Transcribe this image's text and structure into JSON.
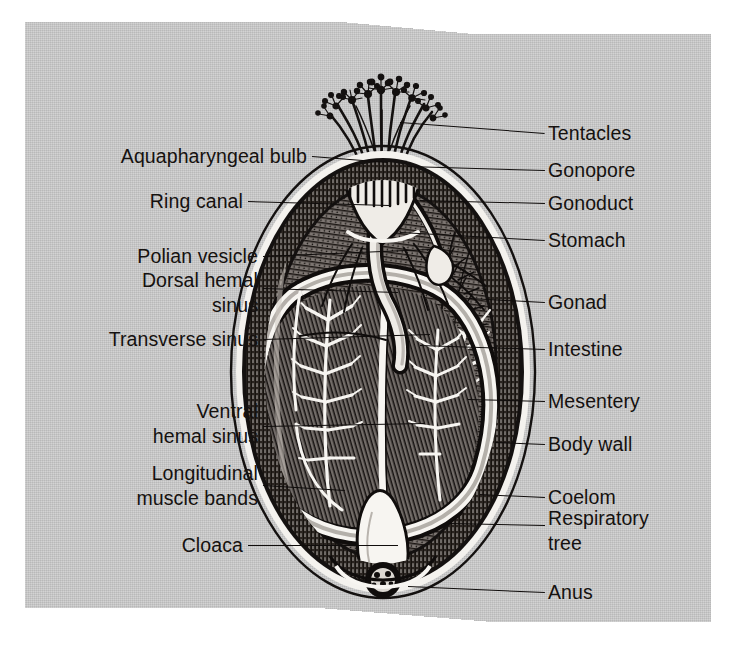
{
  "figure": {
    "background_color": "#c9c9c9",
    "page_color": "#ffffff",
    "ink_color": "#100d0c"
  },
  "labels": {
    "left": [
      {
        "id": "aquapharyngeal-bulb",
        "text": "Aquapharyngeal bulb",
        "x": 307,
        "y": 156,
        "line_x1": 312,
        "line_x2": 388,
        "line_y1": 156,
        "line_y2": 162
      },
      {
        "id": "ring-canal",
        "text": "Ring canal",
        "x": 243,
        "y": 201,
        "line_x1": 248,
        "line_x2": 389,
        "line_y1": 201,
        "line_y2": 205
      },
      {
        "id": "polian-vesicle",
        "text": "Polian vesicle",
        "x": 258,
        "y": 256,
        "line_x1": 263,
        "line_x2": 430,
        "line_y1": 256,
        "line_y2": 249
      },
      {
        "id": "dorsal-hemal-sinus",
        "text": "Dorsal hemal\nsinus",
        "x": 258,
        "y": 293,
        "line_x1": 263,
        "line_x2": 398,
        "line_y1": 288,
        "line_y2": 292
      },
      {
        "id": "transverse-sinus",
        "text": "Transverse sinus",
        "x": 258,
        "y": 339,
        "line_x1": 263,
        "line_x2": 430,
        "line_y1": 339,
        "line_y2": 334
      },
      {
        "id": "ventral-hemal-sinus",
        "text": "Ventral\nhemal sinus",
        "x": 258,
        "y": 424,
        "line_x1": 263,
        "line_x2": 425,
        "line_y1": 426,
        "line_y2": 423
      },
      {
        "id": "longitudinal-muscle-bands",
        "text": "Longitudinal\nmuscle bands",
        "x": 258,
        "y": 486,
        "line_x1": 263,
        "line_x2": 345,
        "line_y1": 485,
        "line_y2": 490
      },
      {
        "id": "cloaca",
        "text": "Cloaca",
        "x": 243,
        "y": 545,
        "line_x1": 248,
        "line_x2": 398,
        "line_y1": 545,
        "line_y2": 545
      }
    ],
    "right": [
      {
        "id": "tentacles",
        "text": "Tentacles",
        "x": 548,
        "y": 133,
        "line_x1": 400,
        "line_x2": 545,
        "line_y1": 122,
        "line_y2": 133
      },
      {
        "id": "gonopore",
        "text": "Gonopore",
        "x": 548,
        "y": 170,
        "line_x1": 408,
        "line_x2": 545,
        "line_y1": 166,
        "line_y2": 170
      },
      {
        "id": "gonoduct",
        "text": "Gonoduct",
        "x": 548,
        "y": 203,
        "line_x1": 420,
        "line_x2": 545,
        "line_y1": 200,
        "line_y2": 203
      },
      {
        "id": "stomach",
        "text": "Stomach",
        "x": 548,
        "y": 240,
        "line_x1": 400,
        "line_x2": 545,
        "line_y1": 232,
        "line_y2": 240
      },
      {
        "id": "gonad",
        "text": "Gonad",
        "x": 548,
        "y": 302,
        "line_x1": 470,
        "line_x2": 545,
        "line_y1": 298,
        "line_y2": 302
      },
      {
        "id": "intestine",
        "text": "Intestine",
        "x": 548,
        "y": 349,
        "line_x1": 420,
        "line_x2": 545,
        "line_y1": 345,
        "line_y2": 349
      },
      {
        "id": "mesentery",
        "text": "Mesentery",
        "x": 548,
        "y": 401,
        "line_x1": 468,
        "line_x2": 545,
        "line_y1": 399,
        "line_y2": 401
      },
      {
        "id": "body-wall",
        "text": "Body wall",
        "x": 548,
        "y": 444,
        "line_x1": 495,
        "line_x2": 545,
        "line_y1": 442,
        "line_y2": 444
      },
      {
        "id": "coelom",
        "text": "Coelom",
        "x": 548,
        "y": 497,
        "line_x1": 480,
        "line_x2": 545,
        "line_y1": 494,
        "line_y2": 497
      },
      {
        "id": "respiratory-tree",
        "text": "Respiratory\ntree",
        "x": 548,
        "y": 531,
        "line_x1": 450,
        "line_x2": 545,
        "line_y1": 523,
        "line_y2": 525
      },
      {
        "id": "anus",
        "text": "Anus",
        "x": 548,
        "y": 592,
        "line_x1": 408,
        "line_x2": 545,
        "line_y1": 586,
        "line_y2": 592
      }
    ]
  },
  "structures": {
    "body_outline": "oval body wall, layered: thin outer cuticle, white gap, dense hatched muscular wall",
    "tentacles": "branched crown of feeding tentacles at oral (top) end",
    "respiratory_tree": "finely branched white tree filling right side of coelom",
    "intestine": "large looped white-outlined tube forming a D in the body cavity",
    "cloaca": "pale bulb at aboral (bottom) end leading to anus"
  }
}
